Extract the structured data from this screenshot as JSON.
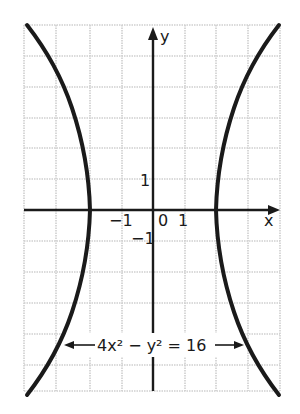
{
  "figure": {
    "equation_label": "4x² − y² = 16",
    "axis_x_label": "x",
    "axis_y_label": "y",
    "tick_labels": {
      "x_neg_one": "−1",
      "origin": "0",
      "x_pos_one": "1",
      "y_pos_one": "1",
      "y_neg_one": "−1"
    },
    "colors": {
      "curve": "#1a1a1a",
      "axis": "#1a1a1a",
      "grid": "#c8c8c8",
      "background": "#ffffff"
    }
  }
}
